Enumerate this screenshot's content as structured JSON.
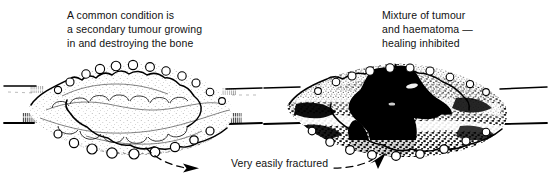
{
  "figure": {
    "background_color": "#ffffff",
    "ink_color": "#000000"
  },
  "panels": [
    {
      "id": "left",
      "caption": "A common condition is\na secondary tumour growing\nin and destroying the bone",
      "lesion_description": "lobulated pale secondary tumour expanding and destroying the bone shaft",
      "fill": "light-stippled"
    },
    {
      "id": "right",
      "caption": "Mixture of tumour\nand haematoma —\nhealing inhibited",
      "lesion_description": "tumour mixed with dense black haematoma at a fracture through the shaft",
      "fill": "dense-black"
    }
  ],
  "annotation": {
    "label": "Very easily fractured",
    "arrows": [
      {
        "name": "arrow-to-left-lesion",
        "direction": "right",
        "style": "dashed-curve"
      },
      {
        "name": "arrow-to-right-lesion",
        "direction": "up-right",
        "style": "dashed-curve"
      }
    ]
  }
}
